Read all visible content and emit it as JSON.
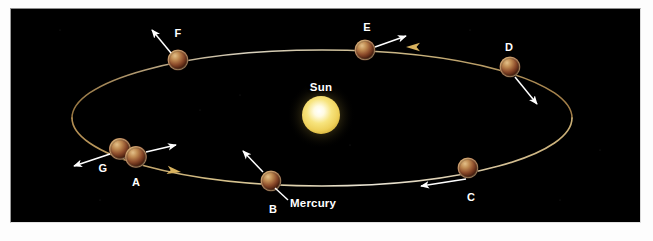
{
  "figure": {
    "background_color": "#000000",
    "page_color": "#fdfdfd"
  },
  "colors": {
    "orbit_line": "#c9a86a",
    "orbit_line_bright": "#e8e2cf",
    "sun_core": "#fffdf0",
    "sun_mid": "#f6e27a",
    "sun_edge": "#e8c84a",
    "planet_light": "#d9b074",
    "planet_mid": "#8a4a2c",
    "planet_dark": "#2a1008",
    "label_text": "#ffffff",
    "arrow": "#ffffff",
    "orbit_arrow": "#d8b25e"
  },
  "sun": {
    "label": "Sun",
    "label_x": 321,
    "label_y": 87,
    "cx": 321,
    "cy": 115,
    "r": 19
  },
  "callouts": [
    {
      "name": "mercury-callout",
      "label": "Mercury",
      "label_x": 290,
      "label_y": 203,
      "leader_from_x": 287,
      "leader_from_y": 199,
      "leader_to_x": 275,
      "leader_to_y": 188
    }
  ],
  "orbit": {
    "cx": 322,
    "cy": 118,
    "rx": 250,
    "ry": 68,
    "direction_label": "counterclockwise-in-view",
    "direction_arrows": [
      {
        "name": "orbit-direction-arrow-top",
        "x": 418,
        "y": 47,
        "angle": 186
      },
      {
        "name": "orbit-direction-arrow-bottom",
        "x": 180,
        "y": 172,
        "angle": 9
      }
    ]
  },
  "planets": [
    {
      "id": "A",
      "label": "A",
      "cx": 135,
      "cy": 157,
      "r": 11,
      "label_x": 136,
      "label_y": 182,
      "arrow": {
        "x1": 146,
        "y1": 152,
        "x2": 176,
        "y2": 145
      }
    },
    {
      "id": "G",
      "label": "G",
      "cx": 120,
      "cy": 149,
      "r": 11,
      "label_x": 103,
      "label_y": 168,
      "arrow": {
        "x1": 110,
        "y1": 154,
        "x2": 74,
        "y2": 166
      }
    },
    {
      "id": "B",
      "label": "B",
      "cx": 271,
      "cy": 181,
      "r": 11,
      "label_x": 273,
      "label_y": 209,
      "arrow": {
        "x1": 263,
        "y1": 172,
        "x2": 243,
        "y2": 151
      }
    },
    {
      "id": "C",
      "label": "C",
      "cx": 468,
      "cy": 168,
      "r": 11,
      "label_x": 471,
      "label_y": 197,
      "arrow": {
        "x1": 466,
        "y1": 179,
        "x2": 421,
        "y2": 186
      }
    },
    {
      "id": "D",
      "label": "D",
      "cx": 510,
      "cy": 67,
      "r": 11,
      "label_x": 509,
      "label_y": 47,
      "arrow": {
        "x1": 515,
        "y1": 77,
        "x2": 537,
        "y2": 104
      }
    },
    {
      "id": "E",
      "label": "E",
      "cx": 365,
      "cy": 50,
      "r": 11,
      "label_x": 367,
      "label_y": 27,
      "arrow": {
        "x1": 375,
        "y1": 47,
        "x2": 406,
        "y2": 36
      }
    },
    {
      "id": "F",
      "label": "F",
      "cx": 178,
      "cy": 60,
      "r": 11,
      "label_x": 178,
      "label_y": 33,
      "arrow": {
        "x1": 171,
        "y1": 53,
        "x2": 152,
        "y2": 30
      }
    }
  ]
}
